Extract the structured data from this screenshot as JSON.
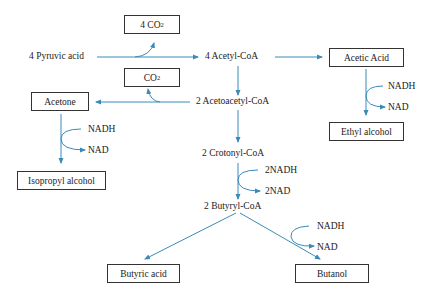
{
  "diagram": {
    "title": "",
    "arrow_color": "#3a8ab8",
    "nodes": {
      "co2_top": {
        "main": "4 CO",
        "sub": "2"
      },
      "co2_mid": {
        "main": "CO",
        "sub": "2"
      },
      "pyruvic": "4 Pyruvic acid",
      "acetyl_coa": "4 Acetyl-CoA",
      "acetic_acid": "Acetic Acid",
      "acetone": "Acetone",
      "acetoacetyl_coa": "2 Acetoacetyl-CoA",
      "ethyl_alcohol": "Ethyl alcohol",
      "isopropyl_alcohol": "Isopropyl alcohol",
      "crotonyl_coa": "2 Crotonyl-CoA",
      "butyryl_coa": "2 Butyryl-CoA",
      "butyric_acid": "Butyric acid",
      "butanol": "Butanol"
    },
    "cofactors": {
      "acetic_in": "NADH",
      "acetic_out": "NAD",
      "acetone_in": "NADH",
      "acetone_out": "NAD",
      "crotonyl_in": "2NADH",
      "crotonyl_out": "2NAD",
      "butanol_in": "NADH",
      "butanol_out": "NAD"
    },
    "edges": [
      {
        "from": "4 Pyruvic acid",
        "to": "4 Acetyl-CoA",
        "side_product": "4 CO2"
      },
      {
        "from": "4 Acetyl-CoA",
        "to": "Acetic Acid"
      },
      {
        "from": "4 Acetyl-CoA",
        "to": "2 Acetoacetyl-CoA"
      },
      {
        "from": "Acetic Acid",
        "to": "Ethyl alcohol",
        "cofactor": "NADH → NAD"
      },
      {
        "from": "2 Acetoacetyl-CoA",
        "to": "Acetone",
        "side_product": "CO2"
      },
      {
        "from": "Acetone",
        "to": "Isopropyl alcohol",
        "cofactor": "NADH → NAD"
      },
      {
        "from": "2 Acetoacetyl-CoA",
        "to": "2 Crotonyl-CoA"
      },
      {
        "from": "2 Crotonyl-CoA",
        "to": "2 Butyryl-CoA",
        "cofactor": "2NADH → 2NAD"
      },
      {
        "from": "2 Butyryl-CoA",
        "to": "Butyric acid"
      },
      {
        "from": "2 Butyryl-CoA",
        "to": "Butanol",
        "cofactor": "NADH → NAD"
      }
    ]
  }
}
